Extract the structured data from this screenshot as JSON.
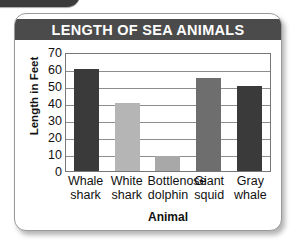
{
  "decor": {
    "corner_badge": "corner-badge-shape"
  },
  "card": {
    "title": "LENGTH OF SEA ANIMALS",
    "title_bar_color": "#4b4b4b",
    "title_text_color": "#ffffff",
    "background": "#ffffff",
    "border_color": "#9a9a9a"
  },
  "chart_data": {
    "type": "bar",
    "title": "LENGTH OF SEA ANIMALS",
    "xlabel": "Animal",
    "ylabel": "Length in Feet",
    "categories": [
      "Whale\nshark",
      "White\nshark",
      "Bottlenose\ndolphin",
      "Giant\nsquid",
      "Gray\nwhale"
    ],
    "values": [
      60,
      40,
      9,
      55,
      50
    ],
    "bar_colors": [
      "#3a3a3a",
      "#b5b5b5",
      "#a8a8a8",
      "#6e6e6e",
      "#3a3a3a"
    ],
    "ylim": [
      0,
      70
    ],
    "yticks": [
      70,
      60,
      50,
      40,
      30,
      20,
      10,
      0
    ],
    "grid": true,
    "grid_orientation": "horizontal",
    "legend": "none",
    "plot_border_color": "#777777",
    "gridline_color": "#8d8d8d"
  }
}
